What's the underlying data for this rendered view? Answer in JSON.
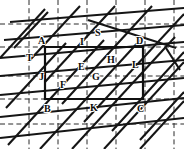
{
  "figure": {
    "width": 184,
    "height": 149,
    "background_color": "#ffffff",
    "line_color": "#151515",
    "grid_color": "#2b2b2b"
  },
  "grid": {
    "style": "dash-dot",
    "vertical_x": [
      29,
      58,
      87,
      116,
      145,
      174
    ],
    "horizontal_y": [
      24,
      47,
      76,
      99,
      124
    ]
  },
  "rectangle": {
    "name": "ABCD",
    "corners": {
      "A": [
        45,
        47
      ],
      "D": [
        143,
        47
      ],
      "C": [
        143,
        99
      ],
      "B": [
        45,
        99
      ]
    }
  },
  "solid_lines": [
    {
      "id": "s1",
      "x1": 10,
      "y1": 22,
      "x2": 184,
      "y2": 8
    },
    {
      "id": "s2",
      "x1": 4,
      "y1": 40,
      "x2": 184,
      "y2": 25
    },
    {
      "id": "s3",
      "x1": 0,
      "y1": 58,
      "x2": 184,
      "y2": 42
    },
    {
      "id": "s4",
      "x1": 0,
      "y1": 76,
      "x2": 184,
      "y2": 60
    },
    {
      "id": "s5",
      "x1": 0,
      "y1": 95,
      "x2": 184,
      "y2": 78
    },
    {
      "id": "s6",
      "x1": 0,
      "y1": 117,
      "x2": 184,
      "y2": 98
    },
    {
      "id": "s7",
      "x1": 0,
      "y1": 138,
      "x2": 184,
      "y2": 118
    },
    {
      "id": "d1",
      "x1": 0,
      "y1": 58,
      "x2": 45,
      "y2": 9
    },
    {
      "id": "d2",
      "x1": 6,
      "y1": 108,
      "x2": 66,
      "y2": 43
    },
    {
      "id": "d3",
      "x1": 8,
      "y1": 145,
      "x2": 104,
      "y2": 40
    },
    {
      "id": "d4",
      "x1": 40,
      "y1": 149,
      "x2": 142,
      "y2": 38
    },
    {
      "id": "d5",
      "x1": 72,
      "y1": 149,
      "x2": 175,
      "y2": 37
    },
    {
      "id": "d6",
      "x1": 104,
      "y1": 149,
      "x2": 184,
      "y2": 62
    },
    {
      "id": "d7",
      "x1": 140,
      "y1": 149,
      "x2": 184,
      "y2": 101
    },
    {
      "id": "d8",
      "x1": 48,
      "y1": 12,
      "x2": 14,
      "y2": 48
    },
    {
      "id": "d9",
      "x1": 80,
      "y1": 6,
      "x2": 30,
      "y2": 60
    },
    {
      "id": "d10",
      "x1": 115,
      "y1": 6,
      "x2": 45,
      "y2": 82
    },
    {
      "id": "d11",
      "x1": 152,
      "y1": 6,
      "x2": 62,
      "y2": 104
    },
    {
      "id": "d12",
      "x1": 184,
      "y1": 14,
      "x2": 84,
      "y2": 122
    },
    {
      "id": "d13",
      "x1": 184,
      "y1": 52,
      "x2": 112,
      "y2": 131
    },
    {
      "id": "d14",
      "x1": 184,
      "y1": 92,
      "x2": 140,
      "y2": 140
    },
    {
      "id": "z1",
      "x1": 88,
      "y1": 20,
      "x2": 176,
      "y2": 48
    },
    {
      "id": "z2",
      "x1": 166,
      "y1": 48,
      "x2": 180,
      "y2": 70
    }
  ],
  "labels": [
    {
      "text": "A",
      "x": 38,
      "y": 36
    },
    {
      "text": "S",
      "x": 95,
      "y": 28
    },
    {
      "text": "I",
      "x": 80,
      "y": 37
    },
    {
      "text": "D",
      "x": 136,
      "y": 36
    },
    {
      "text": "T",
      "x": 26,
      "y": 53
    },
    {
      "text": "H",
      "x": 107,
      "y": 55
    },
    {
      "text": "L",
      "x": 132,
      "y": 60
    },
    {
      "text": "E",
      "x": 78,
      "y": 62
    },
    {
      "text": "J",
      "x": 39,
      "y": 72
    },
    {
      "text": "G",
      "x": 92,
      "y": 72
    },
    {
      "text": "F",
      "x": 60,
      "y": 80
    },
    {
      "text": "B",
      "x": 44,
      "y": 104
    },
    {
      "text": "K",
      "x": 90,
      "y": 103
    },
    {
      "text": "C",
      "x": 137,
      "y": 104
    }
  ]
}
